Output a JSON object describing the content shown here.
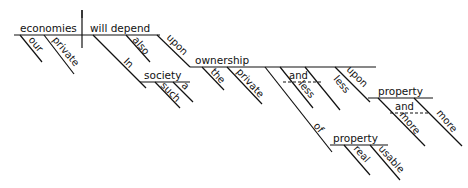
{
  "diagram": {
    "type": "Reed-Kellogg sentence diagram",
    "sentence_words": {
      "subject": "economies",
      "subject_modifiers": [
        "our",
        "private"
      ],
      "verb": "will depend",
      "verb_modifiers": [
        "also"
      ],
      "prep_phrase_1": {
        "preposition": "In",
        "object": "society",
        "modifiers": [
          "such",
          "a"
        ]
      },
      "prep_phrase_2": {
        "preposition": "upon",
        "object": "ownership",
        "modifiers": [
          "the",
          "private"
        ],
        "compound_modifier": {
          "conjunction": "and",
          "left": "less",
          "right": "less"
        },
        "nested_prep": {
          "preposition": "of",
          "object": "property",
          "modifiers": [
            "real",
            "usable"
          ]
        }
      },
      "prep_phrase_3": {
        "preposition": "upon",
        "object": "property",
        "compound_modifier": {
          "conjunction": "and",
          "left": "more",
          "right": "more"
        }
      }
    }
  }
}
